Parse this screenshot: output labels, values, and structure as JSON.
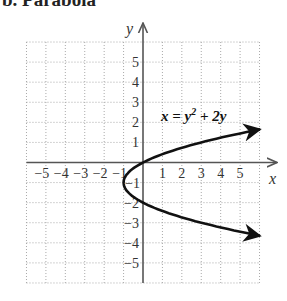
{
  "title": "b. Parabola",
  "chart_data": {
    "type": "line",
    "title": "b. Parabola",
    "xlabel": "x",
    "ylabel": "y",
    "xlim": [
      -6,
      6
    ],
    "ylim": [
      -6,
      6
    ],
    "grid": true,
    "grid_style": "dotted",
    "x_ticks": [
      -5,
      -4,
      -3,
      -2,
      -1,
      1,
      2,
      3,
      4,
      5
    ],
    "y_ticks": [
      5,
      4,
      3,
      2,
      1,
      -1,
      -2,
      -3,
      -4,
      -5
    ],
    "x_tick_labels": [
      "−5",
      "−4",
      "−3",
      "−2",
      "−1",
      "1",
      "2",
      "3",
      "4",
      "5"
    ],
    "y_tick_labels": [
      "5",
      "4",
      "3",
      "2",
      "1",
      "−1",
      "−2",
      "−3",
      "−4",
      "−5"
    ],
    "series": [
      {
        "name": "x = y² + 2y",
        "equation": "x = y^2 + 2y",
        "parametric_in": "y",
        "y_range": [
          -3.65,
          1.65
        ],
        "vertex": [
          -1,
          -1
        ],
        "points": [
          {
            "x": 6.0,
            "y": 1.65
          },
          {
            "x": 3,
            "y": 1
          },
          {
            "x": 0,
            "y": 0
          },
          {
            "x": -1,
            "y": -1
          },
          {
            "x": 0,
            "y": -2
          },
          {
            "x": 3,
            "y": -3
          },
          {
            "x": 6.0,
            "y": -3.65
          }
        ],
        "arrows_at_ends": true
      }
    ],
    "annotations": [
      {
        "text": "x = y² + 2y",
        "x": 3.6,
        "y": 2.1
      }
    ]
  },
  "labels": {
    "x_axis": "x",
    "y_axis": "y",
    "equation_lhs": "x = y",
    "equation_exp": "2",
    "equation_rhs": " + 2y"
  },
  "colors": {
    "grid": "#a8a8a8",
    "axis": "#555555",
    "curve": "#111111"
  }
}
